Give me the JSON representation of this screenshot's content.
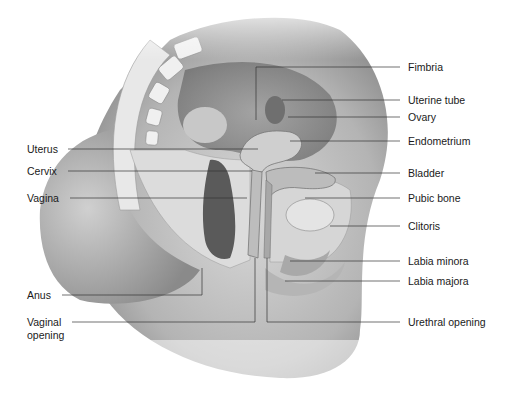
{
  "diagram": {
    "labels_left": [
      {
        "id": "uterus",
        "text": "Uterus",
        "x": 27,
        "y": 143,
        "line": {
          "x1": 68,
          "y1": 149,
          "x2": 258,
          "y2": 149
        }
      },
      {
        "id": "cervix",
        "text": "Cervix",
        "x": 27,
        "y": 165,
        "line": {
          "x1": 68,
          "y1": 171,
          "x2": 252,
          "y2": 171
        }
      },
      {
        "id": "vagina",
        "text": "Vagina",
        "x": 27,
        "y": 192,
        "line": {
          "x1": 70,
          "y1": 198,
          "x2": 247,
          "y2": 198
        }
      },
      {
        "id": "anus",
        "text": "Anus",
        "x": 27,
        "y": 290,
        "line": {
          "x1": 62,
          "y1": 295,
          "x2": 202,
          "y2": 295,
          "x3": 202,
          "y3": 268
        }
      },
      {
        "id": "vaginal-opening",
        "text": "Vaginal",
        "text2": "opening",
        "x": 27,
        "y": 316,
        "line": {
          "x1": 72,
          "y1": 322,
          "x2": 255,
          "y2": 322,
          "x3": 255,
          "y3": 258
        }
      }
    ],
    "labels_right": [
      {
        "id": "fimbria",
        "text": "Fimbria",
        "x": 408,
        "y": 62,
        "line": {
          "x1": 256,
          "y1": 67,
          "x2": 400,
          "y2": 67,
          "x3": 256,
          "y3": 120
        }
      },
      {
        "id": "uterine-tube",
        "text": "Uterine tube",
        "x": 408,
        "y": 95,
        "line": {
          "x1": 282,
          "y1": 100,
          "x2": 400,
          "y2": 100
        }
      },
      {
        "id": "ovary",
        "text": "Ovary",
        "x": 408,
        "y": 112,
        "line": {
          "x1": 288,
          "y1": 117,
          "x2": 400,
          "y2": 117
        }
      },
      {
        "id": "endometrium",
        "text": "Endometrium",
        "x": 408,
        "y": 136,
        "line": {
          "x1": 290,
          "y1": 141,
          "x2": 400,
          "y2": 141
        }
      },
      {
        "id": "bladder",
        "text": "Bladder",
        "x": 408,
        "y": 168,
        "line": {
          "x1": 315,
          "y1": 173,
          "x2": 400,
          "y2": 173
        }
      },
      {
        "id": "pubic-bone",
        "text": "Pubic bone",
        "x": 408,
        "y": 193,
        "line": {
          "x1": 305,
          "y1": 198,
          "x2": 400,
          "y2": 198
        }
      },
      {
        "id": "clitoris",
        "text": "Clitoris",
        "x": 408,
        "y": 221,
        "line": {
          "x1": 330,
          "y1": 226,
          "x2": 400,
          "y2": 226
        }
      },
      {
        "id": "labia-minora",
        "text": "Labia minora",
        "x": 408,
        "y": 256,
        "line": {
          "x1": 290,
          "y1": 261,
          "x2": 400,
          "y2": 261
        }
      },
      {
        "id": "labia-majora",
        "text": "Labia majora",
        "x": 408,
        "y": 276,
        "line": {
          "x1": 285,
          "y1": 281,
          "x2": 400,
          "y2": 281
        }
      },
      {
        "id": "urethral-opening",
        "text": "Urethral opening",
        "x": 408,
        "y": 317,
        "line": {
          "x1": 267,
          "y1": 322,
          "x2": 400,
          "y2": 322,
          "x3": 267,
          "y3": 258
        }
      }
    ]
  }
}
